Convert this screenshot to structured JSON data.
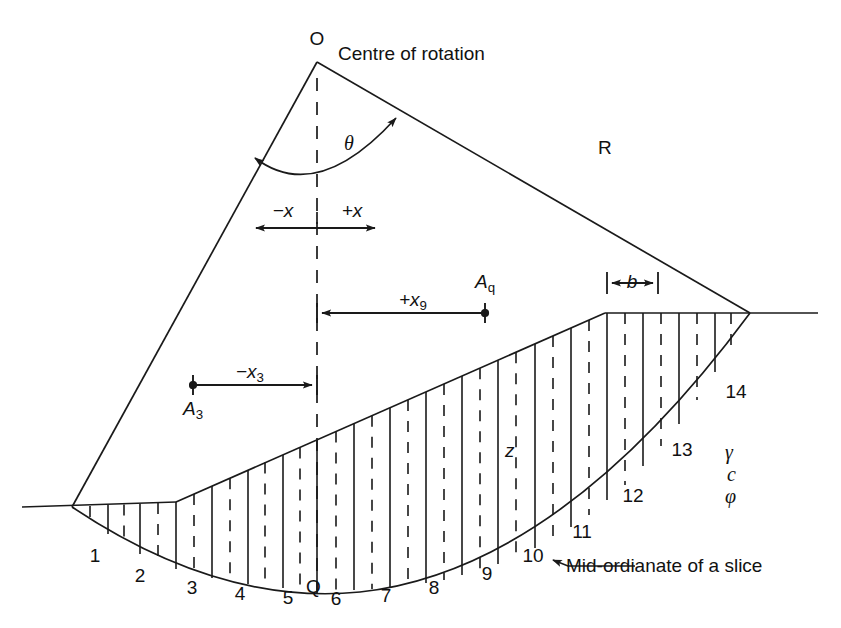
{
  "figure": {
    "stroke_color": "#1a1a1a",
    "text_color": "#111111",
    "background": "#ffffff"
  },
  "labels": {
    "centre_point": "O",
    "centre_caption": "Centre of rotation",
    "radius": "R",
    "theta": "θ",
    "neg_x": "−x",
    "pos_x": "+x",
    "pos_x9_prefix": "+x",
    "pos_x9_sub": "9",
    "neg_x3_prefix": "−x",
    "neg_x3_sub": "3",
    "area_q_prefix": "A",
    "area_q_sub": "q",
    "area_3_prefix": "A",
    "area_3_sub": "3",
    "slice_width": "b",
    "midordinate_symbol": "z",
    "midordinate_caption": "Mid-ordianate of a slice",
    "toe_point": "Q",
    "unit_weight": "γ",
    "cohesion": "c",
    "friction_angle": "φ"
  },
  "slice_numbers": [
    {
      "id": "1",
      "text": "1",
      "x": 95,
      "y": 546
    },
    {
      "id": "2",
      "text": "2",
      "x": 140,
      "y": 566
    },
    {
      "id": "3",
      "text": "3",
      "x": 192,
      "y": 578
    },
    {
      "id": "4",
      "text": "4",
      "x": 240,
      "y": 584
    },
    {
      "id": "5",
      "text": "5",
      "x": 288,
      "y": 588
    },
    {
      "id": "6",
      "text": "6",
      "x": 336,
      "y": 589
    },
    {
      "id": "7",
      "text": "7",
      "x": 386,
      "y": 586
    },
    {
      "id": "8",
      "text": "8",
      "x": 434,
      "y": 578
    },
    {
      "id": "9",
      "text": "9",
      "x": 487,
      "y": 564
    },
    {
      "id": "10",
      "text": "10",
      "x": 533,
      "y": 546
    },
    {
      "id": "11",
      "text": "11",
      "x": 582,
      "y": 522
    },
    {
      "id": "12",
      "text": "12",
      "x": 633,
      "y": 486
    },
    {
      "id": "13",
      "text": "13",
      "x": 682,
      "y": 440
    },
    {
      "id": "14",
      "text": "14",
      "x": 736,
      "y": 382
    }
  ],
  "geometry": {
    "centre_of_rotation": {
      "x": 317,
      "y": 62
    },
    "toe": {
      "x": 72,
      "y": 507
    },
    "crest_right": {
      "x": 750,
      "y": 313
    },
    "slope_toe_break": {
      "x": 176,
      "y": 502
    },
    "slope_crest_break": {
      "x": 605,
      "y": 313
    },
    "ground_left_end": {
      "x": 22,
      "y": 507
    },
    "ground_right_end": {
      "x": 818,
      "y": 313
    },
    "radius_label_position": {
      "x": 607,
      "y": 148
    },
    "number_of_slices": 14,
    "slice_boundaries_x": [
      72,
      108,
      140,
      176,
      212,
      248,
      283,
      317,
      354,
      390,
      426,
      462,
      498,
      535,
      571,
      607,
      643,
      679,
      715,
      750
    ],
    "dimension_lines": {
      "x_axis_arrow": {
        "x1": 253,
        "x2": 378,
        "y": 228
      },
      "x9_arrow": {
        "x1": 317,
        "x2": 485,
        "y": 313
      },
      "x3_arrow": {
        "x1": 193,
        "x2": 317,
        "y": 385
      },
      "b_arrow": {
        "x1": 607,
        "x2": 658,
        "y": 283
      }
    }
  },
  "soil_properties": [
    "γ",
    "c",
    "φ"
  ]
}
